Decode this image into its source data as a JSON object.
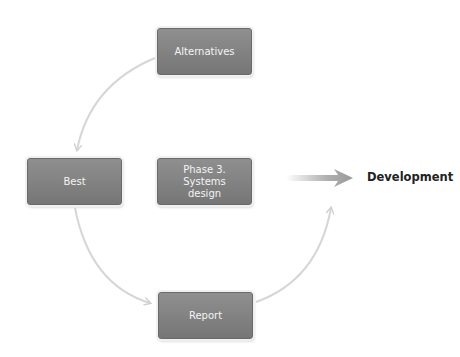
{
  "diagram": {
    "nodes": [
      {
        "id": "alternatives",
        "label": "Alternatives"
      },
      {
        "id": "best",
        "label": "Best"
      },
      {
        "id": "phase3",
        "label": "Phase 3.\nSystems\ndesign"
      },
      {
        "id": "report",
        "label": "Report"
      }
    ],
    "edges": [
      {
        "from": "alternatives",
        "to": "best",
        "style": "curved-arrow"
      },
      {
        "from": "best",
        "to": "report",
        "style": "curved-arrow"
      },
      {
        "from": "report",
        "to": "development",
        "style": "curved-arrow"
      },
      {
        "from": "phase3",
        "to": "development",
        "style": "gradient-arrow"
      }
    ],
    "target": {
      "id": "development",
      "label": "Development"
    },
    "colors": {
      "node_fill_top": "#8f8f8f",
      "node_fill_bottom": "#767676",
      "node_text": "#f4f4f4",
      "connector": "#d6d6d6",
      "target_text": "#222222"
    }
  }
}
